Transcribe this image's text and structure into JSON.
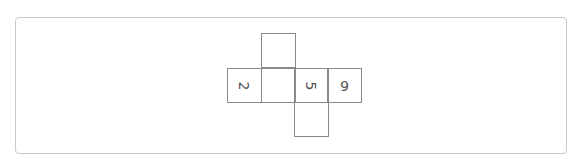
{
  "diagram": {
    "type": "cube-net",
    "faces": [
      {
        "id": "top",
        "label": "",
        "rotation": "none"
      },
      {
        "id": "left",
        "label": "2",
        "rotation": "rotated-90-clockwise"
      },
      {
        "id": "center",
        "label": "",
        "rotation": "none"
      },
      {
        "id": "center-right",
        "label": "5",
        "rotation": "rotated-90-clockwise"
      },
      {
        "id": "right",
        "label": "6",
        "rotation": "rotated-180"
      },
      {
        "id": "bottom",
        "label": "",
        "rotation": "none"
      }
    ]
  },
  "colors": {
    "panel_border": "#c9c9c9",
    "cell_border": "#8a8a8a",
    "glyph": "#555555"
  }
}
